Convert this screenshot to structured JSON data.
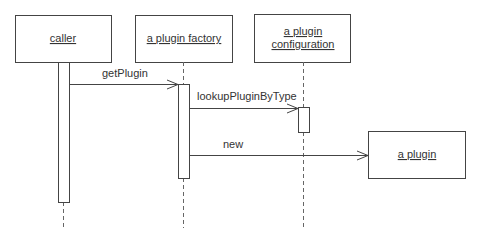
{
  "diagram": {
    "type": "sequence",
    "participants": [
      {
        "id": "caller",
        "label": "caller",
        "lines": [
          "caller"
        ]
      },
      {
        "id": "factory",
        "label": "a plugin factory",
        "lines": [
          "a plugin factory"
        ]
      },
      {
        "id": "config",
        "label": "a plugin configuration",
        "lines": [
          "a plugin",
          "configuration"
        ]
      },
      {
        "id": "plugin",
        "label": "a plugin",
        "lines": [
          "a plugin"
        ]
      }
    ],
    "messages": [
      {
        "from": "caller",
        "to": "factory",
        "label": "getPlugin"
      },
      {
        "from": "factory",
        "to": "config",
        "label": "lookupPluginByType"
      },
      {
        "from": "factory",
        "to": "plugin",
        "label": "new"
      }
    ],
    "colors": {
      "line": "#444444",
      "text": "#333333",
      "background": "#ffffff"
    }
  }
}
